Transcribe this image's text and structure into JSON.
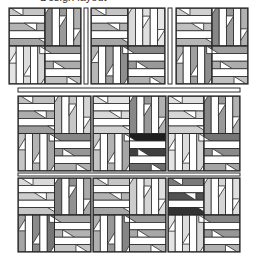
{
  "caption": "Design layout",
  "colors": {
    "outline": "#2a2a2a",
    "sashing_fill": "#ffffff",
    "background": "#ffffff"
  },
  "layout": {
    "rows": [
      {
        "y": 8,
        "h": 76,
        "blocks": [
          {
            "x": 9,
            "w": 72,
            "q": {
              "tl": "#a6a6a6",
              "tr": "#878787",
              "bl": "#d6d6d6",
              "br": "#9e9e9e"
            }
          },
          {
            "x": 91,
            "w": 74,
            "q": {
              "tl": "#a6a6a6",
              "tr": "#dadada",
              "bl": "#8e8e8e",
              "br": "#878787"
            }
          },
          {
            "x": 176,
            "w": 72,
            "q": {
              "tl": "#b6b6b6",
              "tr": "#878787",
              "bl": "#8e8e8e",
              "br": "#9e9e9e"
            }
          }
        ],
        "vertical_sashing": [
          {
            "x": 84,
            "w": 4
          },
          {
            "x": 168,
            "w": 4
          }
        ]
      },
      {
        "y": 96,
        "h": 75,
        "blocks": [
          {
            "x": 18,
            "w": 73,
            "q": {
              "tl": "#9e9e9e",
              "tr": "#bdbdbd",
              "bl": "#a6a6a6",
              "br": "#858585"
            }
          },
          {
            "x": 93,
            "w": 73,
            "q": {
              "tl": "#d2d2d2",
              "tr": "#878787",
              "bl": "#a6a6a6",
              "br": "#1e1e1e"
            }
          },
          {
            "x": 168,
            "w": 72,
            "q": {
              "tl": "#cfcfcf",
              "tr": "#878787",
              "bl": "#d6d6d6",
              "br": "#757575"
            }
          }
        ],
        "vertical_sashing": []
      },
      {
        "y": 178,
        "h": 74,
        "blocks": [
          {
            "x": 18,
            "w": 73,
            "q": {
              "tl": "#c6c6c6",
              "tr": "#7e7e7e",
              "bl": "#757575",
              "br": "#a6a6a6"
            }
          },
          {
            "x": 93,
            "w": 73,
            "q": {
              "tl": "#a6a6a6",
              "tr": "#cdcdcd",
              "bl": "#858585",
              "br": "#979797"
            }
          },
          {
            "x": 168,
            "w": 72,
            "q": {
              "tl": "#333333",
              "tr": "#cdcdcd",
              "bl": "#d6d6d6",
              "br": "#858585"
            }
          }
        ],
        "vertical_sashing": []
      }
    ],
    "horizontal_sashing": [
      {
        "x": 18,
        "y": 88,
        "w": 222,
        "h": 4
      },
      {
        "x": 18,
        "y": 173,
        "w": 222,
        "h": 3
      }
    ],
    "strips_per_quadrant": 5
  }
}
